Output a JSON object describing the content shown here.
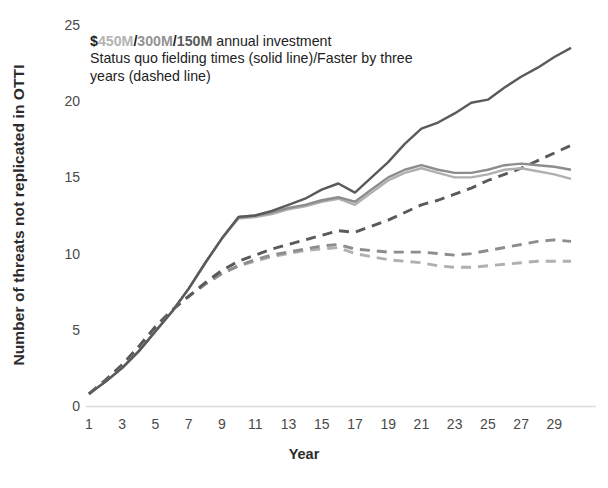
{
  "chart_data": {
    "type": "line",
    "title": "",
    "xlabel": "Year",
    "ylabel": "Number of threats not replicated in OTTI",
    "xlim": [
      1,
      30
    ],
    "ylim": [
      0,
      25
    ],
    "ytick_labels": [
      "0",
      "5",
      "10",
      "15",
      "20",
      "25"
    ],
    "ytick_values": [
      0,
      5,
      10,
      15,
      20,
      25
    ],
    "xtick_labels": [
      "1",
      "3",
      "5",
      "7",
      "9",
      "11",
      "13",
      "15",
      "17",
      "19",
      "21",
      "23",
      "25",
      "27",
      "29"
    ],
    "xtick_values": [
      1,
      3,
      5,
      7,
      9,
      11,
      13,
      15,
      17,
      19,
      21,
      23,
      25,
      27,
      29
    ],
    "grid": false,
    "legend": "none",
    "x": [
      1,
      2,
      3,
      4,
      5,
      6,
      7,
      8,
      9,
      10,
      11,
      12,
      13,
      14,
      15,
      16,
      17,
      18,
      19,
      20,
      21,
      22,
      23,
      24,
      25,
      26,
      27,
      28,
      29,
      30
    ],
    "series": [
      {
        "name": "$150M annual investment, status quo fielding times",
        "label": "150M-solid",
        "color": "#5a5a5a",
        "style": "solid",
        "values": [
          0.8,
          1.6,
          2.5,
          3.6,
          4.9,
          6.2,
          7.7,
          9.4,
          11.0,
          12.4,
          12.5,
          12.8,
          13.2,
          13.6,
          14.2,
          14.6,
          14.0,
          15.0,
          16.0,
          17.2,
          18.2,
          18.6,
          19.2,
          19.9,
          20.1,
          20.9,
          21.6,
          22.2,
          22.9,
          23.5
        ]
      },
      {
        "name": "$300M annual investment, status quo fielding times",
        "label": "300M-solid",
        "color": "#8d8d8d",
        "style": "solid",
        "values": [
          0.8,
          1.6,
          2.5,
          3.6,
          4.9,
          6.2,
          7.7,
          9.4,
          11.0,
          12.4,
          12.5,
          12.7,
          13.0,
          13.2,
          13.5,
          13.7,
          13.4,
          14.2,
          15.0,
          15.5,
          15.8,
          15.5,
          15.3,
          15.3,
          15.5,
          15.8,
          15.9,
          15.8,
          15.7,
          15.5
        ]
      },
      {
        "name": "$450M annual investment, status quo fielding times",
        "label": "450M-solid",
        "color": "#b0b0b0",
        "style": "solid",
        "values": [
          0.8,
          1.6,
          2.5,
          3.6,
          4.9,
          6.2,
          7.7,
          9.4,
          11.0,
          12.3,
          12.4,
          12.6,
          12.9,
          13.1,
          13.4,
          13.6,
          13.2,
          14.0,
          14.8,
          15.3,
          15.6,
          15.3,
          15.0,
          15.0,
          15.2,
          15.5,
          15.6,
          15.4,
          15.2,
          14.9
        ]
      },
      {
        "name": "$150M annual investment, faster by three years",
        "label": "150M-dashed",
        "color": "#5a5a5a",
        "style": "dashed",
        "values": [
          0.8,
          1.7,
          2.7,
          3.9,
          5.2,
          6.3,
          7.2,
          8.1,
          8.9,
          9.5,
          9.9,
          10.3,
          10.6,
          10.9,
          11.2,
          11.5,
          11.4,
          11.8,
          12.2,
          12.7,
          13.2,
          13.5,
          13.9,
          14.3,
          14.8,
          15.2,
          15.6,
          16.1,
          16.6,
          17.1
        ]
      },
      {
        "name": "$300M annual investment, faster by three years",
        "label": "300M-dashed",
        "color": "#8d8d8d",
        "style": "dashed",
        "values": [
          0.8,
          1.7,
          2.7,
          3.9,
          5.2,
          6.3,
          7.2,
          8.0,
          8.7,
          9.2,
          9.6,
          9.9,
          10.1,
          10.3,
          10.5,
          10.6,
          10.3,
          10.2,
          10.1,
          10.1,
          10.1,
          10.0,
          9.9,
          10.0,
          10.2,
          10.4,
          10.6,
          10.8,
          10.9,
          10.8
        ]
      },
      {
        "name": "$450M annual investment, faster by three years",
        "label": "450M-dashed",
        "color": "#b0b0b0",
        "style": "dashed",
        "values": [
          0.8,
          1.7,
          2.7,
          3.9,
          5.2,
          6.3,
          7.2,
          8.0,
          8.7,
          9.2,
          9.5,
          9.8,
          10.0,
          10.2,
          10.3,
          10.4,
          10.0,
          9.8,
          9.6,
          9.5,
          9.4,
          9.2,
          9.1,
          9.1,
          9.2,
          9.3,
          9.4,
          9.5,
          9.5,
          9.5
        ]
      }
    ]
  },
  "annotation": {
    "dollar": "$",
    "amount_450": "450M",
    "sep1": "/",
    "amount_300": "300M",
    "sep2": "/",
    "amount_150": "150M",
    "suffix": " annual investment",
    "line2": "Status quo fielding times (solid line)/Faster by three",
    "line3": "years (dashed line)"
  },
  "colors": {
    "c450": "#b0b0b0",
    "c300": "#8d8d8d",
    "c150": "#5a5a5a",
    "axis": "#d8d8d8",
    "text": "#3a3a3a"
  }
}
